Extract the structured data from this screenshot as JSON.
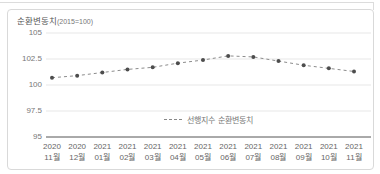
{
  "chart_data": {
    "type": "line",
    "title": {
      "main": "순환변동치",
      "unit": "(2015=100)"
    },
    "legend": {
      "label": "선행지수 순환변동치",
      "marker": "dashed-line",
      "position": "bottom-center"
    },
    "x_labels": {
      "years": [
        "2020",
        "2020",
        "2021",
        "2021",
        "2021",
        "2021",
        "2021",
        "2021",
        "2021",
        "2021",
        "2021",
        "2021",
        "2021"
      ],
      "months": [
        "11월",
        "12월",
        "01월",
        "02월",
        "03월",
        "04월",
        "05월",
        "06월",
        "07월",
        "08월",
        "09월",
        "10월",
        "11월"
      ]
    },
    "series": [
      {
        "name": "선행지수 순환변동치",
        "line_style": "dashed",
        "values": [
          100.7,
          100.9,
          101.2,
          101.5,
          101.7,
          102.1,
          102.4,
          102.8,
          102.7,
          102.3,
          101.9,
          101.6,
          101.3
        ]
      }
    ],
    "y_axis": {
      "min": 95,
      "max": 105,
      "tick_values": [
        105,
        102.5,
        100,
        97.5,
        95
      ],
      "tick_labels": [
        "105",
        "102.5",
        "100",
        "97.5",
        "95"
      ]
    },
    "grid": true,
    "theme": {
      "line_color": "#8c8c8c",
      "dot_color": "#4d4d4d",
      "grid_color": "#e7e7e7",
      "axis_color": "#555555",
      "card_border_color": "#d9d9d9",
      "label_color": "#666666"
    }
  }
}
